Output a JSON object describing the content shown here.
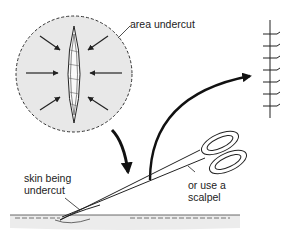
{
  "diagram": {
    "type": "medical-procedure-illustration",
    "labels": {
      "area_undercut": "area undercut",
      "skin_line1": "skin being",
      "skin_line2": "undercut",
      "alt_line1": "or use a",
      "alt_line2": "scalpel"
    },
    "elements": [
      "circular-inset-shaded-area",
      "elliptical-wound-incision",
      "eight-inward-arrows",
      "curved-arrow-down",
      "curved-arrow-up-right",
      "sutured-wound-result",
      "scissors",
      "skin-cross-section"
    ],
    "colors": {
      "shade": "#e6e6e6",
      "line": "#222222"
    }
  }
}
